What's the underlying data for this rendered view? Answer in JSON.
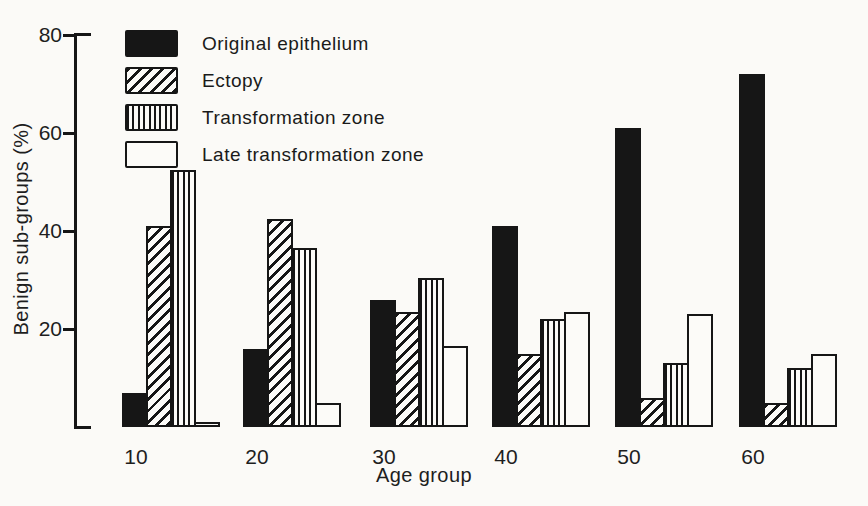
{
  "figure": {
    "ink_color": "#161616",
    "paper_color": "#fbfaf7"
  },
  "chart_data": {
    "type": "bar",
    "title": "",
    "xlabel": "Age group",
    "ylabel": "Benign sub-groups (%)",
    "ylim": [
      0,
      80
    ],
    "yticks": [
      20,
      40,
      60,
      80
    ],
    "grid": false,
    "legend_position": "top-left-inside",
    "categories": [
      "10",
      "20",
      "30",
      "40",
      "50",
      "60"
    ],
    "series": [
      {
        "name": "Original epithelium",
        "pattern": "solid",
        "values": [
          7,
          16,
          26,
          41,
          61,
          72
        ]
      },
      {
        "name": "Ectopy",
        "pattern": "diagonal-hatch",
        "values": [
          41,
          42.5,
          23.5,
          15,
          6,
          5
        ]
      },
      {
        "name": "Transformation zone",
        "pattern": "vertical-lines",
        "values": [
          52.5,
          36.5,
          30.5,
          22,
          13,
          12
        ]
      },
      {
        "name": "Late transformation zone",
        "pattern": "open",
        "values": [
          1,
          5,
          16.5,
          23.5,
          23,
          15
        ]
      }
    ]
  }
}
